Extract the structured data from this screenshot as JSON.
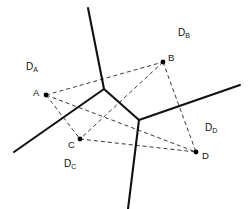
{
  "figure": {
    "type": "voronoi-delaunay-diagram",
    "width": 252,
    "height": 209,
    "background_color": "#ffffff"
  },
  "colors": {
    "voronoi_edge": "#111111",
    "delaunay_edge": "#3a3a3a",
    "site_dot": "#000000",
    "label_text": "#111111"
  },
  "sites": [
    {
      "id": "A",
      "label": "A",
      "x": 46,
      "y": 95,
      "label_x": 33,
      "label_y": 88
    },
    {
      "id": "B",
      "label": "B",
      "x": 163,
      "y": 62,
      "label_x": 168,
      "label_y": 53
    },
    {
      "id": "C",
      "label": "C",
      "x": 80,
      "y": 139,
      "label_x": 68,
      "label_y": 140
    },
    {
      "id": "D",
      "label": "D",
      "x": 196,
      "y": 152,
      "label_x": 202,
      "label_y": 151
    }
  ],
  "region_labels": [
    {
      "id": "DA",
      "base": "D",
      "sub": "A",
      "x": 26,
      "y": 62
    },
    {
      "id": "DB",
      "base": "D",
      "sub": "B",
      "x": 178,
      "y": 28
    },
    {
      "id": "DC",
      "base": "D",
      "sub": "C",
      "x": 64,
      "y": 159
    },
    {
      "id": "DD",
      "base": "D",
      "sub": "D",
      "x": 205,
      "y": 123
    }
  ],
  "voronoi_vertices": [
    {
      "id": "V1",
      "x": 104,
      "y": 89
    },
    {
      "id": "V2",
      "x": 139,
      "y": 120
    }
  ],
  "voronoi_edges": [
    {
      "id": "v1-v2",
      "from": "V1",
      "to": "V2",
      "points": "104,89 139,120"
    },
    {
      "id": "v1-north",
      "from": "V1",
      "to": "ray",
      "points": "104,89 88,8"
    },
    {
      "id": "v1-southwest",
      "from": "V1",
      "to": "ray",
      "points": "104,89 14,152"
    },
    {
      "id": "v2-northeast",
      "from": "V2",
      "to": "ray",
      "points": "139,120 240,85"
    },
    {
      "id": "v2-south",
      "from": "V2",
      "to": "ray",
      "points": "139,120 128,209"
    }
  ],
  "delaunay_edges": [
    {
      "id": "A-B",
      "from": "A",
      "to": "B",
      "points": "46,95 163,62"
    },
    {
      "id": "A-C",
      "from": "A",
      "to": "C",
      "points": "46,95 80,139"
    },
    {
      "id": "A-D",
      "from": "A",
      "to": "D",
      "points": "46,95 196,152"
    },
    {
      "id": "B-C",
      "from": "B",
      "to": "C",
      "points": "163,62 80,139"
    },
    {
      "id": "B-D",
      "from": "B",
      "to": "D",
      "points": "163,62 196,152"
    },
    {
      "id": "C-D",
      "from": "C",
      "to": "D",
      "points": "80,139 196,152"
    }
  ]
}
